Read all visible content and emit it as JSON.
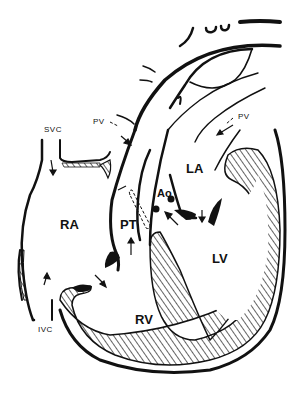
{
  "diagram": {
    "type": "anatomical-line-drawing",
    "labels": {
      "svc": "SVC",
      "ivc": "IVC",
      "pv_left": "PV",
      "pv_right": "PV",
      "ra": "RA",
      "rv": "RV",
      "la": "LA",
      "lv": "LV",
      "pt": "PT",
      "ao": "Ao"
    },
    "colors": {
      "ink": "#111111",
      "background": "#ffffff"
    }
  }
}
